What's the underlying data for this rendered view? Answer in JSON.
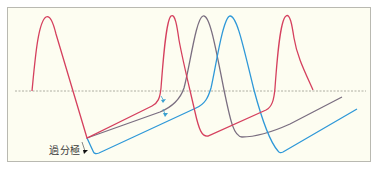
{
  "diagram": {
    "type": "action-potential-train",
    "annotation_label": "過分極",
    "colors": {
      "background": "#fdfdf1",
      "border": "#b9b9b1",
      "baseline": "#9a9a90",
      "red_trace": "#d5405e",
      "grey_trace": "#7a6e80",
      "blue_trace": "#2e98d8",
      "arrow": "#3aa0d0",
      "label": "#3a3a3a"
    },
    "traces": [
      {
        "name": "red",
        "description": "three action potentials with shallow afterhyperpolarization ramps"
      },
      {
        "name": "grey",
        "description": "delayed second action potential after deeper hyperpolarization"
      },
      {
        "name": "blue",
        "description": "most delayed second action potential after deepest hyperpolarization"
      }
    ],
    "arrows": [
      {
        "name": "shift-arrow-1",
        "description": "downward shift red to grey ramp"
      },
      {
        "name": "shift-arrow-2",
        "description": "downward shift grey to blue ramp"
      }
    ]
  }
}
